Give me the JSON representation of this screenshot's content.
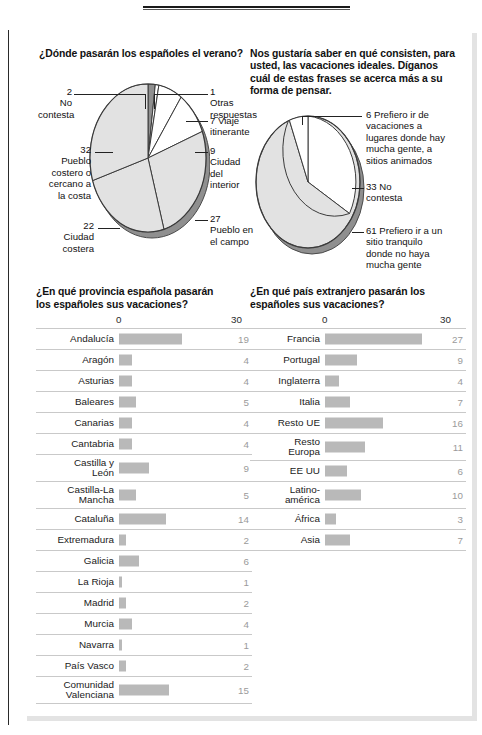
{
  "palette": {
    "bar_fill": "#b9b9b9",
    "pie_light": "#ffffff",
    "pie_mid": "#e2e2e2",
    "pie_dark": "#8f8f8f",
    "rule": "#c9c9c9",
    "value_text": "#9a9a9a"
  },
  "pie1": {
    "title": "¿Dónde pasarán los españoles el verano?",
    "labels": [
      {
        "id": "no-contesta",
        "value": "2",
        "text": "2\nNo\ncontesta",
        "side": "left"
      },
      {
        "id": "otras-respuestas",
        "value": "1",
        "text": "1\nOtras\nrespuestas",
        "side": "right"
      },
      {
        "id": "viaje-itinerante",
        "value": "7",
        "text": "7 Viaje\nitinerante",
        "side": "right"
      },
      {
        "id": "ciudad-del-interior",
        "value": "9",
        "text": "9\nCiudad\ndel\ninterior",
        "side": "right"
      },
      {
        "id": "pueblo-en-el-campo",
        "value": "27",
        "text": "27\nPueblo en\nel campo",
        "side": "right"
      },
      {
        "id": "ciudad-costera",
        "value": "22",
        "text": "22\nCiudad\ncostera",
        "side": "left"
      },
      {
        "id": "pueblo-costero",
        "value": "32",
        "text": "32\nPueblo\ncostero o\ncercano a\nla costa",
        "side": "left"
      }
    ]
  },
  "pie2": {
    "title": "Nos gustaría saber en qué consisten, para usted, las vacaciones ideales. Díganos cuál de estas frases se acerca más a su forma de pensar.",
    "labels": [
      {
        "id": "mucha-gente",
        "value": "6",
        "text": "6 Prefiero ir de\nvacaciones a\nlugares donde hay\nmucha gente, a\nsitios animados"
      },
      {
        "id": "no-contesta",
        "value": "33",
        "text": "33 No\ncontesta"
      },
      {
        "id": "sitio-tranquilo",
        "value": "61",
        "text": "61 Prefiero ir a un\nsitio tranquilo\ndonde no haya\nmucha gente"
      }
    ]
  },
  "chart_data": [
    {
      "id": "pie-verano",
      "type": "pie",
      "title": "¿Dónde pasarán los españoles el verano?",
      "categories": [
        "No contesta",
        "Otras respuestas",
        "Viaje itinerante",
        "Ciudad del interior",
        "Pueblo en el campo",
        "Ciudad costera",
        "Pueblo costero o cercano a la costa"
      ],
      "values": [
        2,
        1,
        7,
        9,
        27,
        22,
        32
      ],
      "legend": "callout-labels",
      "grid": false
    },
    {
      "id": "pie-vacaciones-ideales",
      "type": "pie",
      "title": "Nos gustaría saber en qué consisten, para usted, las vacaciones ideales. Díganos cuál de estas frases se acerca más a su forma de pensar.",
      "categories": [
        "Prefiero ir de vacaciones a lugares donde hay mucha gente, a sitios animados",
        "No contesta",
        "Prefiero ir a un sitio tranquilo donde no haya mucha gente"
      ],
      "values": [
        6,
        33,
        61
      ],
      "legend": "callout-labels",
      "grid": false
    },
    {
      "id": "bar-provincias",
      "type": "bar",
      "orientation": "horizontal",
      "title": "¿En qué provincia española pasarán los españoles sus vacaciones?",
      "xlabel": "",
      "ylabel": "",
      "xlim": [
        0,
        30
      ],
      "ticks": [
        "0",
        "30"
      ],
      "categories": [
        "Andalucía",
        "Aragón",
        "Asturias",
        "Baleares",
        "Canarias",
        "Cantabria",
        "Castilla y León",
        "Castilla-La Mancha",
        "Cataluña",
        "Extremadura",
        "Galicia",
        "La Rioja",
        "Madrid",
        "Murcia",
        "Navarra",
        "País Vasco",
        "Comunidad Valenciana"
      ],
      "values": [
        19,
        4,
        4,
        5,
        4,
        4,
        9,
        5,
        14,
        2,
        6,
        1,
        2,
        4,
        1,
        2,
        15
      ],
      "grid": false
    },
    {
      "id": "bar-paises",
      "type": "bar",
      "orientation": "horizontal",
      "title": "¿En qué país extranjero pasarán los españoles sus vacaciones?",
      "xlabel": "",
      "ylabel": "",
      "xlim": [
        0,
        30
      ],
      "ticks": [
        "0",
        "30"
      ],
      "categories": [
        "Francia",
        "Portugal",
        "Inglaterra",
        "Italia",
        "Resto UE",
        "Resto Europa",
        "EE UU",
        "Latino-américa",
        "África",
        "Asia"
      ],
      "values": [
        27,
        9,
        4,
        7,
        16,
        11,
        6,
        10,
        3,
        7
      ],
      "grid": false
    }
  ],
  "bar1": {
    "title": "¿En qué provincia española pasarán los españoles sus vacaciones?",
    "zero": "0",
    "max": "30",
    "rows": [
      {
        "label": "Andalucía",
        "value": "19"
      },
      {
        "label": "Aragón",
        "value": "4"
      },
      {
        "label": "Asturias",
        "value": "4"
      },
      {
        "label": "Baleares",
        "value": "5"
      },
      {
        "label": "Canarias",
        "value": "4"
      },
      {
        "label": "Cantabria",
        "value": "4"
      },
      {
        "label": "Castilla y\nLeón",
        "value": "9"
      },
      {
        "label": "Castilla-La\nMancha",
        "value": "5"
      },
      {
        "label": "Cataluña",
        "value": "14"
      },
      {
        "label": "Extremadura",
        "value": "2"
      },
      {
        "label": "Galicia",
        "value": "6"
      },
      {
        "label": "La Rioja",
        "value": "1"
      },
      {
        "label": "Madrid",
        "value": "2"
      },
      {
        "label": "Murcia",
        "value": "4"
      },
      {
        "label": "Navarra",
        "value": "1"
      },
      {
        "label": "País Vasco",
        "value": "2"
      },
      {
        "label": "Comunidad\nValenciana",
        "value": "15"
      }
    ]
  },
  "bar2": {
    "title": "¿En qué país extranjero pasarán los españoles sus vacaciones?",
    "zero": "0",
    "max": "30",
    "rows": [
      {
        "label": "Francia",
        "value": "27"
      },
      {
        "label": "Portugal",
        "value": "9"
      },
      {
        "label": "Inglaterra",
        "value": "4"
      },
      {
        "label": "Italia",
        "value": "7"
      },
      {
        "label": "Resto UE",
        "value": "16"
      },
      {
        "label": "Resto\nEuropa",
        "value": "11"
      },
      {
        "label": "EE UU",
        "value": "6"
      },
      {
        "label": "Latino-\namérica",
        "value": "10"
      },
      {
        "label": "África",
        "value": "3"
      },
      {
        "label": "Asia",
        "value": "7"
      }
    ]
  }
}
